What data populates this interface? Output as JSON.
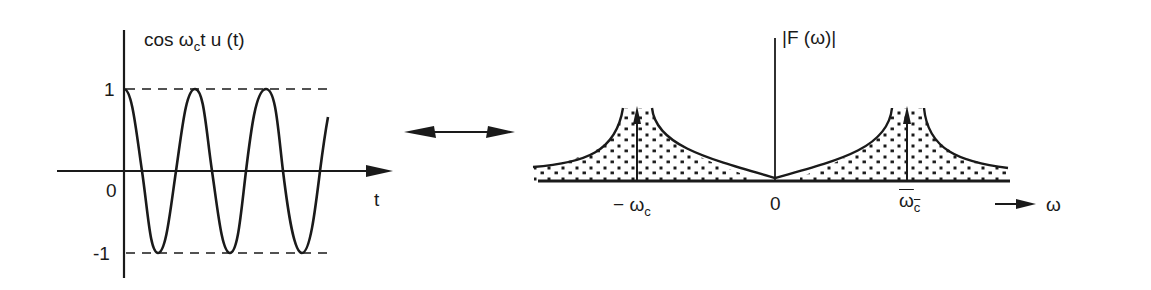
{
  "left_plot": {
    "title": {
      "prefix": "cos ω",
      "subscript": "c",
      "suffix": "t u (t)"
    },
    "y_ticks": [
      "1",
      "0",
      "-1"
    ],
    "x_axis_label": "t",
    "description": "Causal cosine cos(ω_c t)u(t), starting at 1 at t=0, oscillating between +1 and -1"
  },
  "transform_pair_symbol": "⟷",
  "right_plot": {
    "title": "|F (ω)|",
    "x_ticks": {
      "neg": {
        "sign": "−",
        "main": "ω",
        "sub": "c"
      },
      "zero": "0",
      "pos": {
        "main": "ω",
        "sub": "c"
      }
    },
    "x_axis_label": "ω",
    "description": "Magnitude spectrum with impulses at ±ω_c and dotted shaded spread around each"
  },
  "colors": {
    "ink": "#1a1a1a",
    "background": "#ffffff"
  }
}
